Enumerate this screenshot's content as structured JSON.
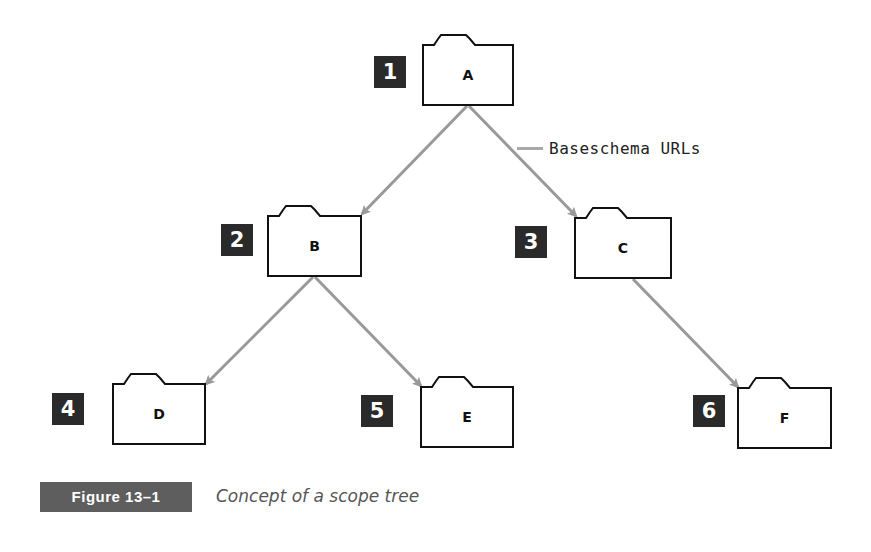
{
  "diagram": {
    "title": "Concept of a scope tree",
    "arrow_color": "#999999",
    "badge_color": "#2a2a2a",
    "nodes": [
      {
        "id": "A",
        "label": "A",
        "number": "1",
        "x": 422,
        "y": 34,
        "w": 92,
        "h": 72,
        "badge": {
          "x": 374,
          "y": 56
        }
      },
      {
        "id": "B",
        "label": "B",
        "number": "2",
        "x": 267,
        "y": 205,
        "w": 95,
        "h": 72,
        "badge": {
          "x": 221,
          "y": 224
        }
      },
      {
        "id": "C",
        "label": "C",
        "number": "3",
        "x": 574,
        "y": 207,
        "w": 98,
        "h": 72,
        "badge": {
          "x": 515,
          "y": 226
        }
      },
      {
        "id": "D",
        "label": "D",
        "number": "4",
        "x": 112,
        "y": 373,
        "w": 94,
        "h": 72,
        "badge": {
          "x": 52,
          "y": 393
        }
      },
      {
        "id": "E",
        "label": "E",
        "number": "5",
        "x": 420,
        "y": 376,
        "w": 94,
        "h": 72,
        "badge": {
          "x": 361,
          "y": 395
        }
      },
      {
        "id": "F",
        "label": "F",
        "number": "6",
        "x": 737,
        "y": 377,
        "w": 95,
        "h": 72,
        "badge": {
          "x": 693,
          "y": 395
        }
      }
    ],
    "edges": [
      {
        "from": "A",
        "to": "B",
        "x1": 467,
        "y1": 106,
        "x2": 362,
        "y2": 214
      },
      {
        "from": "A",
        "to": "C",
        "x1": 469,
        "y1": 106,
        "x2": 576,
        "y2": 216
      },
      {
        "from": "B",
        "to": "D",
        "x1": 313,
        "y1": 277,
        "x2": 206,
        "y2": 384
      },
      {
        "from": "B",
        "to": "E",
        "x1": 315,
        "y1": 277,
        "x2": 421,
        "y2": 386
      },
      {
        "from": "C",
        "to": "F",
        "x1": 633,
        "y1": 279,
        "x2": 738,
        "y2": 387
      }
    ],
    "legend": {
      "label": "Baseschema URLs",
      "x": 517,
      "y": 137
    }
  },
  "figure": {
    "tag": "Figure 13–1",
    "caption": "Concept of a scope tree"
  }
}
